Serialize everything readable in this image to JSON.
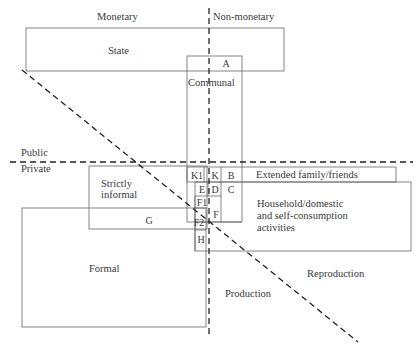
{
  "diagram": {
    "axes": {
      "monetary": "Monetary",
      "non_monetary": "Non-monetary",
      "public": "Public",
      "private": "Private",
      "production": "Production",
      "reproduction": "Reproduction"
    },
    "boxes": {
      "state": "State",
      "communal": "Communal",
      "extended_family": "Extended family/friends",
      "household_line1": "Household/domestic",
      "household_line2": "and self-consumption",
      "household_line3": "activities",
      "strictly_informal_line1": "Strictly",
      "strictly_informal_line2": "informal",
      "formal": "Formal"
    },
    "cells": {
      "a": "A",
      "k1": "K1",
      "k": "K",
      "b": "B",
      "e": "E",
      "d": "D",
      "c": "C",
      "f1": "F1",
      "f2": "F2",
      "f": "F",
      "g": "G",
      "h": "H"
    },
    "colors": {
      "line": "#555555",
      "dashed": "#2a2a2a",
      "text": "#3a3a3a"
    }
  }
}
